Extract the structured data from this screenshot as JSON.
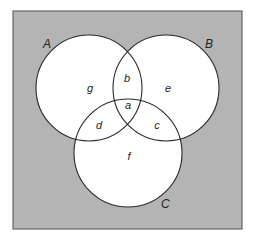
{
  "diagram": {
    "type": "venn",
    "universe": {
      "x": 13,
      "y": 11,
      "width": 229,
      "height": 218,
      "fill": "#b4b4b4",
      "stroke": "#666666"
    },
    "circle_fill": "#ffffff",
    "circle_stroke": "#2a2a2a",
    "sets": [
      {
        "id": "A",
        "label": "A",
        "cx": 89,
        "cy": 88,
        "r": 53,
        "label_x": 43,
        "label_y": 48
      },
      {
        "id": "B",
        "label": "B",
        "cx": 166,
        "cy": 88,
        "r": 53,
        "label_x": 205,
        "label_y": 48
      },
      {
        "id": "C",
        "label": "C",
        "cx": 128,
        "cy": 153,
        "r": 54,
        "label_x": 161,
        "label_y": 208
      }
    ],
    "regions": [
      {
        "id": "g",
        "label": "g",
        "x": 90,
        "y": 92
      },
      {
        "id": "b",
        "label": "b",
        "x": 127,
        "y": 82
      },
      {
        "id": "e",
        "label": "e",
        "x": 168,
        "y": 92
      },
      {
        "id": "a",
        "label": "a",
        "x": 128,
        "y": 109
      },
      {
        "id": "d",
        "label": "d",
        "x": 99,
        "y": 129
      },
      {
        "id": "c",
        "label": "c",
        "x": 157,
        "y": 129
      },
      {
        "id": "f",
        "label": "f",
        "x": 129,
        "y": 160
      }
    ]
  }
}
